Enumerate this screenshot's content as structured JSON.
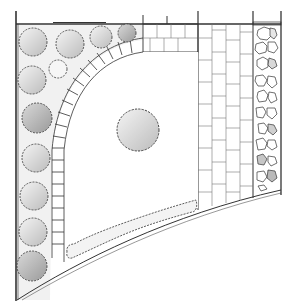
{
  "title": "Garden plan sketch",
  "colors": {
    "background": "#ffffff",
    "ink": "#3a3a3a",
    "shrub_shade": "#cfcfcf",
    "shrub_dark": "#a9a9a9",
    "bed_tint": "#ececec"
  },
  "elements": {
    "boundary_wall": "boundary",
    "lawn": "lawn",
    "center_shrub": "specimen shrub",
    "arc_pavers": "curved paver edging",
    "top_pavers": "paver strip",
    "path": "paved path",
    "gravel_bed": "pebble border",
    "shrub_border": "shrub border",
    "low_hedge": "low hedge"
  }
}
